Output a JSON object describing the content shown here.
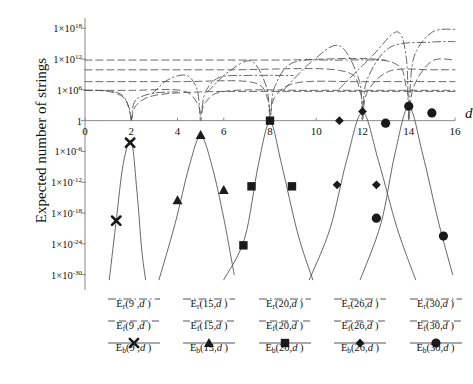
{
  "axes": {
    "ylabel": "Expected number of strings",
    "xlabel": "d",
    "yticks": [
      "1×10",
      "1×10",
      "1×10",
      "1",
      "1×10",
      "1×10",
      "1×10",
      "1×10",
      "1×10"
    ],
    "yexp": [
      "18",
      "12",
      "6",
      "",
      "-6",
      "-12",
      "-18",
      "-24",
      "-30"
    ],
    "xticks": [
      "0",
      "2",
      "4",
      "6",
      "8",
      "10",
      "12",
      "14",
      "16"
    ]
  },
  "legend": {
    "columns": [
      {
        "n": "9",
        "rows": [
          {
            "label": "E",
            "sub": "r",
            "arg": "(9 ,d )",
            "style": "dashdot",
            "marker": "none"
          },
          {
            "label": "E",
            "sub": "f",
            "arg": "(9 ,d )",
            "style": "dashed",
            "marker": "none"
          },
          {
            "label": "E",
            "sub": "b",
            "arg": "(9 ,d )",
            "style": "solid",
            "marker": "cross"
          }
        ]
      },
      {
        "n": "15",
        "rows": [
          {
            "label": "E",
            "sub": "r",
            "arg": "(15,d )",
            "style": "dashdot",
            "marker": "none"
          },
          {
            "label": "E",
            "sub": "f",
            "arg": "(15,d )",
            "style": "dashed",
            "marker": "none"
          },
          {
            "label": "E",
            "sub": "b",
            "arg": "(15,d )",
            "style": "solid",
            "marker": "triangle"
          }
        ]
      },
      {
        "n": "20",
        "rows": [
          {
            "label": "E",
            "sub": "r",
            "arg": "(20,d )",
            "style": "dashdot",
            "marker": "none"
          },
          {
            "label": "E",
            "sub": "f",
            "arg": "(20,d )",
            "style": "dashed",
            "marker": "none"
          },
          {
            "label": "E",
            "sub": "b",
            "arg": "(20,d )",
            "style": "solid",
            "marker": "square"
          }
        ]
      },
      {
        "n": "26",
        "rows": [
          {
            "label": "E",
            "sub": "r",
            "arg": "(26,d )",
            "style": "dashdot",
            "marker": "none"
          },
          {
            "label": "E",
            "sub": "f",
            "arg": "(26,d )",
            "style": "dashed",
            "marker": "none"
          },
          {
            "label": "E",
            "sub": "b",
            "arg": "(26,d )",
            "style": "solid",
            "marker": "diamond"
          }
        ]
      },
      {
        "n": "30",
        "rows": [
          {
            "label": "E",
            "sub": "r",
            "arg": "(30,d )",
            "style": "dashdot",
            "marker": "none"
          },
          {
            "label": "E",
            "sub": "f",
            "arg": "(30,d )",
            "style": "dashed",
            "marker": "none"
          },
          {
            "label": "E",
            "sub": "b",
            "arg": "(30,d )",
            "style": "solid",
            "marker": "circle"
          }
        ]
      }
    ]
  },
  "chart_data": {
    "type": "line",
    "title": "",
    "xlabel": "d",
    "ylabel": "Expected number of strings",
    "xlim": [
      0,
      16
    ],
    "ylim_log10": [
      -33,
      20
    ],
    "yscale": "log",
    "grid": false,
    "legend_position": "below",
    "axis_color": "#8a8a8a",
    "curve_color": "#555555",
    "marker_color": "#1a1a1a",
    "series": [
      {
        "name": "E_r(9,d)",
        "group": "9",
        "style": "dashdot",
        "marker": "none",
        "comment": "plateau near 1e6 for small d then falls steeply to zero near d=2",
        "x": [
          0,
          1,
          1.6,
          1.9,
          2.0,
          2.05,
          2.1,
          2.3,
          3.0,
          4.0
        ],
        "log10y": [
          5.9,
          5.8,
          5.0,
          2.6,
          0.1,
          1.9,
          3.2,
          4.4,
          5.4,
          5.6
        ]
      },
      {
        "name": "E_f(9,d)",
        "group": "9",
        "style": "dashed",
        "marker": "none",
        "x": [
          0,
          1,
          1.7,
          1.95,
          2.0,
          2.2,
          3.0,
          5.0,
          8.0,
          16.0
        ],
        "log10y": [
          5.9,
          5.7,
          4.4,
          1.4,
          0.0,
          2.9,
          4.9,
          5.6,
          5.7,
          5.7
        ]
      },
      {
        "name": "E_b(9,d)",
        "group": "9",
        "style": "solid",
        "marker": "cross",
        "comment": "inverted-V peak at d=2",
        "x": [
          1.05,
          1.35,
          1.65,
          2.0,
          2.25,
          2.45,
          2.62
        ],
        "log10y": [
          -31,
          -19.5,
          -8.5,
          -4.0,
          -14,
          -25,
          -31
        ],
        "markers": [
          {
            "x": 1.35,
            "log10y": -19.5
          },
          {
            "x": 1.95,
            "log10y": -4.3
          }
        ]
      },
      {
        "name": "E_r(15,d)",
        "group": "15",
        "style": "dashdot",
        "marker": "none",
        "x": [
          2.9,
          3.6,
          4.4,
          4.85,
          5.0,
          5.2,
          5.8,
          7.0,
          9.0
        ],
        "log10y": [
          5.2,
          8.0,
          8.8,
          6.0,
          1.0,
          5.5,
          8.4,
          8.8,
          8.8
        ]
      },
      {
        "name": "E_f(15,d)",
        "group": "15",
        "style": "dashed",
        "marker": "none",
        "x": [
          0,
          2.0,
          4.2,
          4.9,
          5.0,
          5.2,
          6.2,
          10.0,
          16.0
        ],
        "log10y": [
          5.9,
          5.9,
          5.85,
          3.0,
          0.0,
          3.5,
          5.8,
          5.9,
          5.9
        ]
      },
      {
        "name": "E_b(15,d)",
        "group": "15",
        "style": "solid",
        "marker": "triangle",
        "comment": "inverted-V peak at d=5",
        "x": [
          3.2,
          3.9,
          4.5,
          5.0,
          5.5,
          6.0,
          6.45
        ],
        "log10y": [
          -31,
          -20,
          -9.0,
          -3.0,
          -9.0,
          -19,
          -30
        ],
        "markers": [
          {
            "x": 4.0,
            "log10y": -15.5
          },
          {
            "x": 5.0,
            "log10y": -2.8
          },
          {
            "x": 6.0,
            "log10y": -13.5
          }
        ]
      },
      {
        "name": "E_r(20,d)",
        "group": "20",
        "style": "dashdot",
        "marker": "none",
        "x": [
          5.3,
          6.2,
          7.2,
          7.85,
          8.0,
          8.2,
          9.0,
          11.0,
          13.0
        ],
        "log10y": [
          5.6,
          9.5,
          11.6,
          6.5,
          1.0,
          6.5,
          11.3,
          11.8,
          11.8
        ]
      },
      {
        "name": "E_f(20,d)",
        "group": "20",
        "style": "dashed",
        "marker": "none",
        "x": [
          0,
          4.0,
          7.2,
          7.9,
          8.0,
          8.2,
          9.2,
          12.0,
          16.0
        ],
        "log10y": [
          7.6,
          7.6,
          7.5,
          4.2,
          0.0,
          4.5,
          7.4,
          7.6,
          7.6
        ]
      },
      {
        "name": "E_b(20,d)",
        "group": "20",
        "style": "solid",
        "marker": "square",
        "comment": "inverted-V peak at d=8",
        "x": [
          6.0,
          6.9,
          7.5,
          8.0,
          8.5,
          9.2,
          9.85
        ],
        "log10y": [
          -31,
          -23,
          -8.5,
          -0.3,
          -8.5,
          -22,
          -31
        ],
        "markers": [
          {
            "x": 6.85,
            "log10y": -24.3
          },
          {
            "x": 7.2,
            "log10y": -12.8
          },
          {
            "x": 8.0,
            "log10y": 0.0
          },
          {
            "x": 8.95,
            "log10y": -12.8
          }
        ]
      },
      {
        "name": "E_r(26,d)",
        "group": "26",
        "style": "dashdot",
        "marker": "none",
        "x": [
          8.6,
          9.8,
          11.0,
          11.85,
          12.0,
          12.2,
          13.2,
          15.0,
          16.0
        ],
        "log10y": [
          6.0,
          11.5,
          14.6,
          8.0,
          1.5,
          8.0,
          14.3,
          15.3,
          15.4
        ]
      },
      {
        "name": "E_f(26,d)",
        "group": "26",
        "style": "dashed",
        "marker": "none",
        "x": [
          0,
          6.0,
          11.0,
          11.9,
          12.0,
          12.2,
          13.2,
          15.0,
          16.0
        ],
        "log10y": [
          9.9,
          9.9,
          9.8,
          5.5,
          0.0,
          5.5,
          9.7,
          9.9,
          9.9
        ]
      },
      {
        "name": "E_b(26,d)",
        "group": "26",
        "style": "solid",
        "marker": "diamond",
        "comment": "inverted-V peak at d=12",
        "x": [
          9.7,
          10.6,
          11.3,
          12.0,
          12.7,
          13.5,
          14.3
        ],
        "log10y": [
          -31,
          -21,
          -8.0,
          1.6,
          -8.0,
          -21,
          -31
        ],
        "markers": [
          {
            "x": 10.9,
            "log10y": -12.5
          },
          {
            "x": 11.0,
            "log10y": 0.0
          },
          {
            "x": 12.0,
            "log10y": 1.8
          },
          {
            "x": 12.6,
            "log10y": -12.5
          }
        ]
      },
      {
        "name": "E_r(30,d)",
        "group": "30",
        "style": "dashdot",
        "marker": "none",
        "x": [
          11.0,
          12.4,
          13.5,
          13.9,
          14.0,
          14.2,
          15.0,
          16.0
        ],
        "log10y": [
          6.2,
          12.5,
          17.3,
          12.0,
          1.5,
          12.0,
          17.2,
          17.8
        ]
      },
      {
        "name": "E_f(30,d)",
        "group": "30",
        "style": "dashed",
        "marker": "none",
        "x": [
          0,
          8.0,
          13.0,
          13.9,
          14.0,
          14.2,
          15.0,
          16.0
        ],
        "log10y": [
          11.8,
          11.8,
          11.7,
          6.5,
          0.0,
          6.5,
          11.6,
          11.8
        ]
      },
      {
        "name": "E_b(30,d)",
        "group": "30",
        "style": "solid",
        "marker": "circle",
        "comment": "inverted-V peak at d=14",
        "x": [
          11.9,
          12.8,
          13.4,
          14.0,
          14.6,
          15.3,
          15.9
        ],
        "log10y": [
          -31,
          -20,
          -6.5,
          2.7,
          -6.5,
          -20,
          -30
        ],
        "markers": [
          {
            "x": 12.6,
            "log10y": -19.0
          },
          {
            "x": 13.0,
            "log10y": -0.5
          },
          {
            "x": 14.0,
            "log10y": 2.8
          },
          {
            "x": 15.0,
            "log10y": 1.5
          },
          {
            "x": 15.5,
            "log10y": -22.5
          }
        ]
      }
    ]
  }
}
